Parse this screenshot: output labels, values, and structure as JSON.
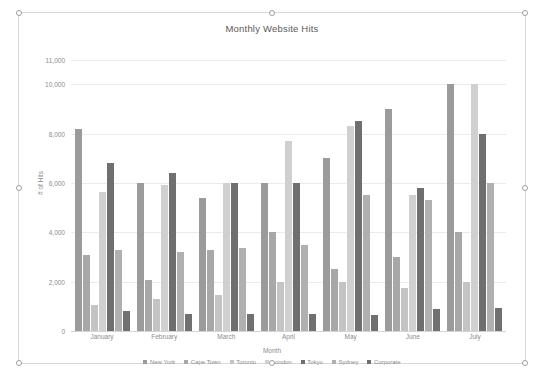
{
  "chart_object": {
    "title_text": "Monthly Website Hits",
    "selected": true
  },
  "chart_data": {
    "type": "bar",
    "title": "Monthly Website Hits",
    "xlabel": "Month",
    "ylabel": "# of Hits",
    "ylim": [
      0,
      12000
    ],
    "yticks": [
      "0",
      "2,000",
      "4,000",
      "6,000",
      "8,000",
      "10,000",
      "11,000"
    ],
    "ytick_values": [
      0,
      2000,
      4000,
      6000,
      8000,
      10000,
      11000
    ],
    "grid": true,
    "legend_position": "bottom",
    "categories": [
      "January",
      "February",
      "March",
      "April",
      "May",
      "June",
      "July"
    ],
    "series": [
      {
        "name": "New York",
        "color": "#9b9b9b",
        "values": [
          8200,
          6000,
          5400,
          6000,
          7000,
          9000,
          10000
        ]
      },
      {
        "name": "Cape Town",
        "color": "#a8a8a8",
        "values": [
          3100,
          2050,
          3300,
          4000,
          2500,
          3000,
          4000
        ]
      },
      {
        "name": "Toronto",
        "color": "#c4c4c4",
        "values": [
          1050,
          1300,
          1450,
          2000,
          2000,
          1750,
          2000
        ]
      },
      {
        "name": "London",
        "color": "#d0d0d0",
        "values": [
          5650,
          5900,
          6000,
          7700,
          8300,
          5500,
          10000
        ]
      },
      {
        "name": "Tokyo",
        "color": "#6f6f6f",
        "values": [
          6800,
          6400,
          6000,
          6000,
          8500,
          5800,
          8000
        ]
      },
      {
        "name": "Sydney",
        "color": "#b0b0b0",
        "values": [
          3300,
          3200,
          3350,
          3500,
          5500,
          5300,
          6000
        ]
      },
      {
        "name": "Corporate",
        "color": "#707070",
        "values": [
          800,
          700,
          700,
          700,
          650,
          900,
          950
        ]
      }
    ]
  }
}
